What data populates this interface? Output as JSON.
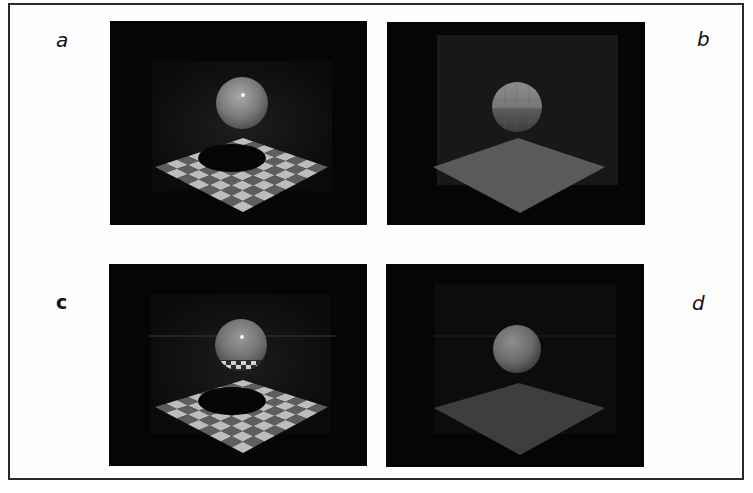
{
  "figure": {
    "panels": [
      {
        "id": "a",
        "label": "a",
        "description": "Ray-traced sphere above checkerboard floor with shadow and specular highlight",
        "floor": "checkerboard",
        "shadow": true,
        "highlight": true,
        "reflection": false
      },
      {
        "id": "b",
        "label": "b",
        "description": "Flat-shaded faceted sphere above plain floor in a room",
        "floor": "plain",
        "shadow": false,
        "highlight": false,
        "reflection": false
      },
      {
        "id": "c",
        "label": "c",
        "description": "Reflective sphere above checkerboard floor showing reflected checker pattern and shadow",
        "floor": "checkerboard",
        "shadow": true,
        "highlight": true,
        "reflection": true
      },
      {
        "id": "d",
        "label": "d",
        "description": "Smooth-shaded sphere above plain floor",
        "floor": "plain",
        "shadow": false,
        "highlight": false,
        "reflection": false
      }
    ],
    "colors": {
      "background": "#050505",
      "wall": "#1a1a1a",
      "sphere": "#8a8a8a",
      "checker_light": "#bdbdbd",
      "checker_dark": "#5e5e5e",
      "plain_floor": "#5a5a5a",
      "shadow": "#050505"
    }
  }
}
